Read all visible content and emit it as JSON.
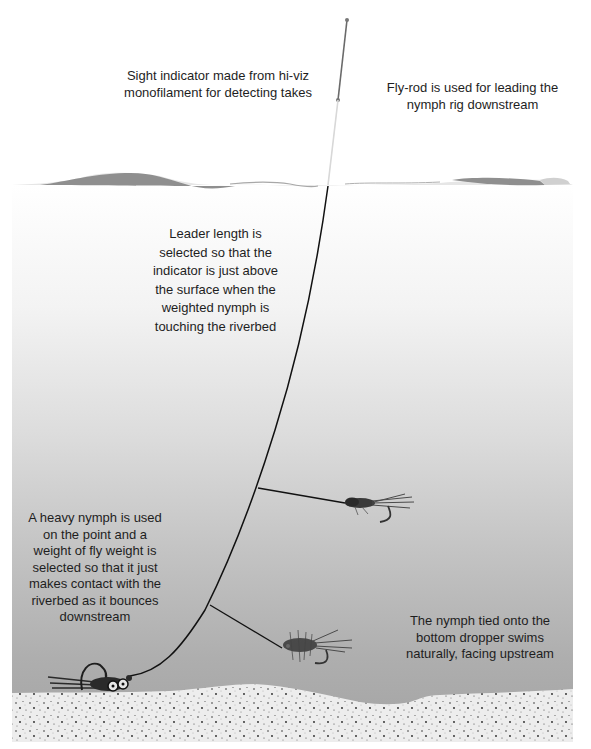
{
  "diagram": {
    "labels": {
      "sight_indicator": "Sight indicator made from hi-viz\nmonofilament for detecting takes",
      "fly_rod": "Fly-rod is used for leading the\nnymph rig downstream",
      "leader_length": "Leader length is\nselected so that the\nindicator is just above\nthe surface when the\nweighted nymph is\ntouching the riverbed",
      "heavy_nymph": "A heavy nymph is used\non the point and a\nweight of fly weight is\nselected so that it just\nmakes contact with the\nriverbed as it bounces\ndownstream",
      "bottom_dropper": "The nymph tied onto the\nbottom dropper swims\nnaturally, facing upstream"
    },
    "elements": [
      {
        "name": "fly-rod-tip",
        "description": "rod tip line above water"
      },
      {
        "name": "sight-indicator",
        "description": "light-coloured monofilament section entering water"
      },
      {
        "name": "water-surface",
        "description": "wavy grey surface band"
      },
      {
        "name": "leader-line",
        "description": "curved leader from surface down to point fly"
      },
      {
        "name": "upper-dropper-nymph",
        "description": "dark nymph on upper dropper tag"
      },
      {
        "name": "bottom-dropper-nymph",
        "description": "fuzzy nymph on lower dropper tag"
      },
      {
        "name": "point-nymph",
        "description": "heavy bead-head jig nymph touching riverbed"
      },
      {
        "name": "riverbed",
        "description": "speckled sandy riverbed"
      }
    ],
    "colors": {
      "water_top": "#f7f7f7",
      "water_mid": "#d0d0d0",
      "water_bottom": "#a0a0a0",
      "riverbed": "#ececec",
      "line": "#111111",
      "surface_dark": "#8a8a8a",
      "surface_light": "#cfcfcf"
    }
  }
}
